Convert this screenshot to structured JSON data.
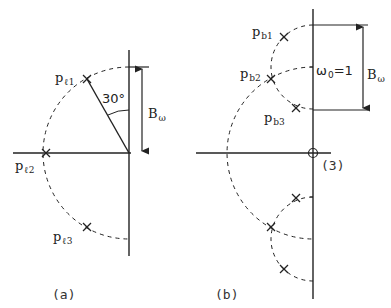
{
  "panel_a": {
    "caption": "(a)",
    "poles": [
      {
        "base": "p",
        "sub": "ℓ1"
      },
      {
        "base": "p",
        "sub": "ℓ2"
      },
      {
        "base": "p",
        "sub": "ℓ3"
      }
    ],
    "angle_label": "30°",
    "bandwidth_label": {
      "base": "B",
      "sub": "ω"
    }
  },
  "panel_b": {
    "caption": "(b)",
    "poles": [
      {
        "base": "p",
        "sub": "b1"
      },
      {
        "base": "p",
        "sub": "b2"
      },
      {
        "base": "p",
        "sub": "b3"
      }
    ],
    "center_label": {
      "base": "ω",
      "sub": "0",
      "rest": "=1"
    },
    "bandwidth_label": {
      "base": "B",
      "sub": "ω"
    },
    "origin_multiplicity": "(3)"
  },
  "colors": {
    "stroke": "#222222",
    "background": "#ffffff"
  }
}
